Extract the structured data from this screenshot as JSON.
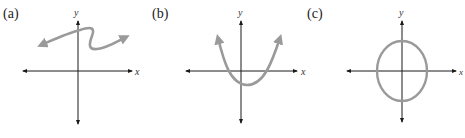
{
  "figure": {
    "panels": [
      {
        "id": "a",
        "label": "(a)",
        "x_axis_label": "x",
        "y_axis_label": "y",
        "curve": "s-shaped curve with arrows at both ends"
      },
      {
        "id": "b",
        "label": "(b)",
        "x_axis_label": "x",
        "y_axis_label": "y",
        "curve": "upward-opening parabola with arrows at both ends"
      },
      {
        "id": "c",
        "label": "(c)",
        "x_axis_label": "x",
        "y_axis_label": "y",
        "curve": "closed ellipse centered at origin"
      }
    ],
    "colors": {
      "axis": "#1a1a1a",
      "curve": "#9a9a9a",
      "background": "#ffffff"
    }
  }
}
